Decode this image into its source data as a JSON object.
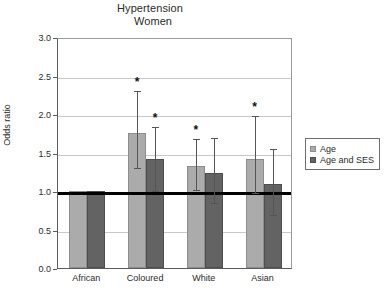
{
  "chart_data": {
    "type": "bar",
    "title": "Hypertension",
    "subtitle": "Women",
    "xlabel": "",
    "ylabel": "Odds ratio",
    "ylim": [
      0.0,
      3.0
    ],
    "ytick_step": 0.5,
    "ytick_labels": [
      "0.0",
      "0.5",
      "1.0",
      "1.5",
      "2.0",
      "2.5",
      "3.0"
    ],
    "ytick_values": [
      0.0,
      0.5,
      1.0,
      1.5,
      2.0,
      2.5,
      3.0
    ],
    "grid": true,
    "grid_axis": "y",
    "legend_position": "right",
    "reference_line": {
      "value": 1.0,
      "color": "#000000",
      "width": 3
    },
    "categories": [
      "African",
      "Coloured",
      "White",
      "Asian"
    ],
    "series": [
      {
        "name": "Age",
        "color": "#ababab",
        "values": [
          1.0,
          1.75,
          1.33,
          1.41
        ],
        "ci_low": [
          null,
          1.32,
          1.04,
          1.0
        ],
        "ci_high": [
          null,
          2.32,
          1.7,
          2.0
        ],
        "significant": [
          false,
          true,
          true,
          true
        ]
      },
      {
        "name": "Age and SES",
        "color": "#636363",
        "values": [
          1.0,
          1.41,
          1.24,
          1.09
        ],
        "ci_low": [
          null,
          1.03,
          0.87,
          0.71
        ],
        "ci_high": [
          null,
          1.86,
          1.72,
          1.57
        ],
        "significant": [
          false,
          true,
          false,
          false
        ]
      }
    ],
    "significance_marker": "*"
  },
  "legend": {
    "entries": [
      {
        "label": "Age"
      },
      {
        "label": "Age and SES"
      }
    ]
  }
}
